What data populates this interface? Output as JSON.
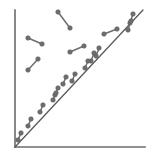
{
  "figure": {
    "width": 155,
    "height": 154,
    "background": "#ffffff",
    "axis_color": "#6b6b6b",
    "axis_width": 1.6,
    "reference_line_color": "#5a5a5a",
    "reference_line_width": 1.3,
    "marker_color": "#6e6e6e",
    "marker_edge_color": "#5a5a5a",
    "marker_radius": 2.3,
    "connector_width": 1.5
  },
  "axes": {
    "y_axis": {
      "x1": 15,
      "y1": 10,
      "x2": 15,
      "y2": 147
    },
    "x_axis": {
      "x1": 15,
      "y1": 147,
      "x2": 145,
      "y2": 147
    }
  },
  "chart_data": {
    "type": "scatter",
    "title": "",
    "subtitle": "",
    "xlabel": "",
    "ylabel": "",
    "xlim": [
      0,
      100
    ],
    "ylim": [
      0,
      100
    ],
    "grid": false,
    "legend": null,
    "annotations": [],
    "xticks": [],
    "yticks": [],
    "reference_line": {
      "name": "identity-diagonal",
      "description": "45-degree y = x reference line from origin to upper right",
      "x": [
        15,
        143
      ],
      "y": [
        147,
        10
      ]
    },
    "marker_style": "dumbbell (two dots joined by a short segment)",
    "series": [
      {
        "name": "dumbbell-pairs",
        "points": [
          {
            "id": 1,
            "x1": 58,
            "y1": 12,
            "x2": 70,
            "y2": 28
          },
          {
            "id": 2,
            "x1": 28,
            "y1": 38,
            "x2": 42,
            "y2": 44
          },
          {
            "id": 3,
            "x1": 28,
            "y1": 70,
            "x2": 38,
            "y2": 59
          },
          {
            "id": 4,
            "x1": 70,
            "y1": 52,
            "x2": 84,
            "y2": 46
          },
          {
            "id": 5,
            "x1": 104,
            "y1": 34,
            "x2": 117,
            "y2": 29
          },
          {
            "id": 6,
            "x1": 130,
            "y1": 23,
            "x2": 133,
            "y2": 14
          },
          {
            "id": 7,
            "x1": 128,
            "y1": 30,
            "x2": 131,
            "y2": 21
          },
          {
            "id": 8,
            "x1": 96,
            "y1": 56,
            "x2": 99,
            "y2": 48
          },
          {
            "id": 9,
            "x1": 91,
            "y1": 61,
            "x2": 94,
            "y2": 53
          },
          {
            "id": 10,
            "x1": 85,
            "y1": 68,
            "x2": 88,
            "y2": 61
          },
          {
            "id": 11,
            "x1": 72,
            "y1": 81,
            "x2": 75,
            "y2": 74
          },
          {
            "id": 12,
            "x1": 63,
            "y1": 84,
            "x2": 66,
            "y2": 77
          },
          {
            "id": 13,
            "x1": 55,
            "y1": 95,
            "x2": 58,
            "y2": 88
          },
          {
            "id": 14,
            "x1": 53,
            "y1": 100,
            "x2": 56,
            "y2": 93
          },
          {
            "id": 15,
            "x1": 40,
            "y1": 112,
            "x2": 43,
            "y2": 105
          },
          {
            "id": 16,
            "x1": 28,
            "y1": 126,
            "x2": 31,
            "y2": 119
          },
          {
            "id": 17,
            "x1": 18,
            "y1": 140,
            "x2": 21,
            "y2": 133
          }
        ]
      }
    ]
  }
}
